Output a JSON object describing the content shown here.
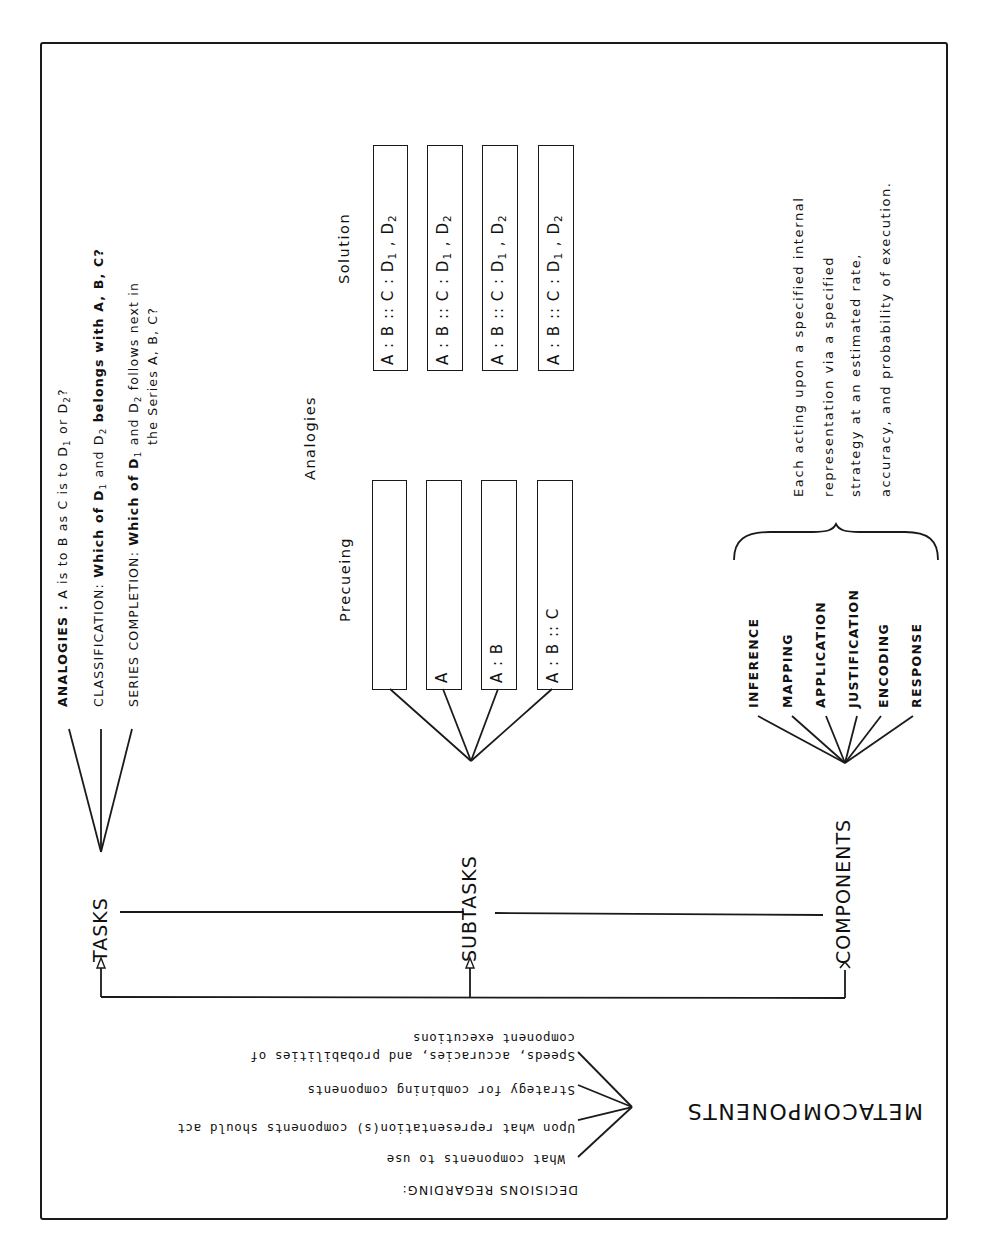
{
  "hierarchy": {
    "levels": [
      "TASKS",
      "SUBTASKS",
      "COMPONENTS"
    ],
    "meta_level": "METACOMPONENTS"
  },
  "tasks": {
    "label": "TASKS",
    "items": [
      {
        "name": "ANALOGIES :",
        "text": "A is to B as C is to D",
        "tail": "or D",
        "q": "?"
      },
      {
        "name": "CLASSIFICATION:",
        "text": "Which of D",
        "mid": "and D",
        "tail": "belongs with A, B, C?"
      },
      {
        "name": "SERIES COMPLETION:",
        "text": "Which of D",
        "mid": "and D",
        "tail": "follows next in",
        "line2": "the Series A, B, C?"
      }
    ],
    "sub1": "1",
    "sub2": "2"
  },
  "subtasks": {
    "label": "SUBTASKS",
    "group_label": "Analogies",
    "precueing_label": "Precueing",
    "solution_label": "Solution",
    "precueing_boxes": [
      "",
      "A",
      "A : B",
      "A : B :: C"
    ],
    "solution_boxes": [
      {
        "pre": "A : B :: C : D",
        "s1": "1",
        "mid": " , D",
        "s2": "2"
      },
      {
        "pre": "A : B :: C : D",
        "s1": "1",
        "mid": " , D",
        "s2": "2"
      },
      {
        "pre": "A : B :: C : D",
        "s1": "1",
        "mid": " , D",
        "s2": "2"
      },
      {
        "pre": "A : B :: C : D",
        "s1": "1",
        "mid": " , D",
        "s2": "2"
      }
    ]
  },
  "components": {
    "label": "COMPONENTS",
    "items": [
      "INFERENCE",
      "MAPPING",
      "APPLICATION",
      "JUSTIFICATION",
      "ENCODING",
      "RESPONSE"
    ],
    "description": [
      "Each acting upon a specified internal",
      "representation via a specified",
      "strategy at an estimated rate,",
      "accuracy, and probability of execution."
    ]
  },
  "metacomponents": {
    "label": "METACOMPONENTS",
    "heading": "DECISIONS REGARDING:",
    "items": [
      "What components to use",
      "Upon what representation(s) components should act",
      "Strategy for combining components",
      "Speeds, accuracies, and probabilities of",
      "component executions"
    ]
  }
}
